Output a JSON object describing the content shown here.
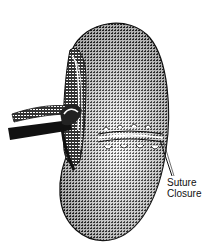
{
  "figure": {
    "label": {
      "line1": "Suture",
      "line2": "Closure"
    },
    "colors": {
      "ink": "#111111",
      "paper": "#ffffff",
      "midtone": "#555555"
    }
  }
}
